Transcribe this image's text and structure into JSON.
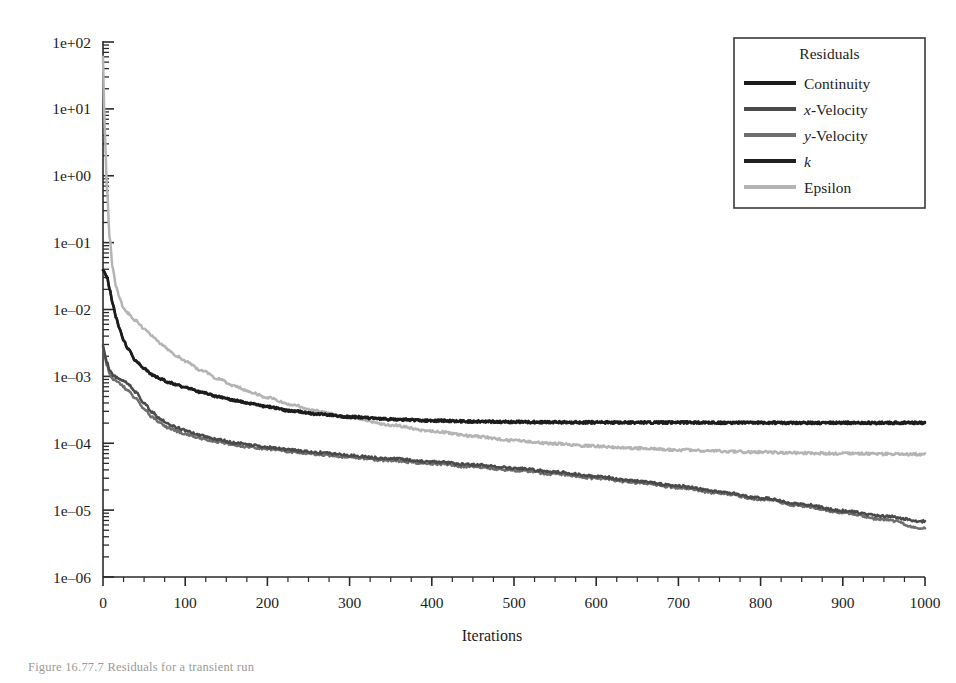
{
  "figure": {
    "caption": "Figure 16.77.7   Residuals for a transient run"
  },
  "chart_data": {
    "type": "line",
    "title": "",
    "xlabel": "Iterations",
    "ylabel": "",
    "xlim": [
      0,
      1000
    ],
    "ylim": [
      1e-06,
      100.0
    ],
    "yscale": "log",
    "grid": false,
    "legend_position": "top-right",
    "legend_title": "Residuals",
    "xticks": [
      0,
      100,
      200,
      300,
      400,
      500,
      600,
      700,
      800,
      900,
      1000
    ],
    "xtick_labels": [
      "0",
      "100",
      "200",
      "300",
      "400",
      "500",
      "600",
      "700",
      "800",
      "900",
      "1000"
    ],
    "yticks": [
      100,
      10,
      1,
      0.1,
      0.01,
      0.001,
      0.0001,
      1e-05,
      1e-06
    ],
    "ytick_labels": [
      "1e+02",
      "1e+01",
      "1e+00",
      "1e-01",
      "1e-02",
      "1e-03",
      "1e-04",
      "1e-05",
      "1e-06"
    ],
    "x": [
      0,
      2,
      5,
      8,
      12,
      16,
      20,
      25,
      30,
      40,
      50,
      60,
      70,
      80,
      90,
      100,
      120,
      140,
      160,
      180,
      200,
      230,
      260,
      300,
      350,
      400,
      450,
      500,
      550,
      600,
      650,
      700,
      750,
      800,
      850,
      900,
      950,
      1000
    ],
    "series": [
      {
        "name": "Continuity",
        "color": "#1c1c1c",
        "values": [
          0.04,
          0.035,
          0.03,
          0.02,
          0.012,
          0.0075,
          0.0052,
          0.0035,
          0.0026,
          0.0017,
          0.0013,
          0.00105,
          0.00092,
          0.00082,
          0.00074,
          0.00068,
          0.00058,
          0.0005,
          0.00044,
          0.00039,
          0.00035,
          0.000305,
          0.000275,
          0.000248,
          0.000228,
          0.000218,
          0.000212,
          0.000208,
          0.000206,
          0.000205,
          0.000204,
          0.000204,
          0.000203,
          0.000203,
          0.000202,
          0.000202,
          0.000202,
          0.000202
        ]
      },
      {
        "name": "x-Velocity",
        "color": "#4a4a4a",
        "values": [
          0.003,
          0.0022,
          0.0016,
          0.0012,
          0.00105,
          0.00098,
          0.00093,
          0.00086,
          0.00078,
          0.00058,
          0.0004,
          0.00029,
          0.00023,
          0.000195,
          0.000172,
          0.000155,
          0.00013,
          0.000114,
          0.000102,
          9.35e-05,
          8.68e-05,
          7.88e-05,
          7.26e-05,
          6.58e-05,
          5.88e-05,
          5.3e-05,
          4.78e-05,
          4.26e-05,
          3.72e-05,
          3.2e-05,
          2.72e-05,
          2.28e-05,
          1.88e-05,
          1.52e-05,
          1.22e-05,
          9.8e-06,
          8.1e-06,
          6.8e-06
        ]
      },
      {
        "name": "y-Velocity",
        "color": "#6e6e6e",
        "values": [
          0.0028,
          0.002,
          0.00145,
          0.00108,
          0.00092,
          0.00084,
          0.00078,
          0.0007,
          0.00062,
          0.00046,
          0.000325,
          0.000245,
          0.000198,
          0.00017,
          0.000152,
          0.000138,
          0.000118,
          0.000104,
          9.45e-05,
          8.72e-05,
          8.15e-05,
          7.42e-05,
          6.85e-05,
          6.2e-05,
          5.52e-05,
          4.95e-05,
          4.44e-05,
          3.96e-05,
          3.48e-05,
          3.02e-05,
          2.58e-05,
          2.18e-05,
          1.8e-05,
          1.46e-05,
          1.16e-05,
          9.2e-06,
          7.2e-06,
          5.3e-06
        ]
      },
      {
        "name": "k",
        "color": "#202020",
        "values": [
          0.04,
          0.035,
          0.03,
          0.02,
          0.012,
          0.0075,
          0.0052,
          0.0035,
          0.0026,
          0.0017,
          0.0013,
          0.00105,
          0.00092,
          0.00082,
          0.00074,
          0.00068,
          0.00058,
          0.0005,
          0.00044,
          0.00039,
          0.00035,
          0.000305,
          0.000275,
          0.000248,
          0.000228,
          0.000218,
          0.000212,
          0.000208,
          0.000206,
          0.000205,
          0.000204,
          0.000204,
          0.000203,
          0.000203,
          0.000202,
          0.000202,
          0.000202,
          0.000202
        ]
      },
      {
        "name": "Epsilon",
        "color": "#b4b4b4",
        "values": [
          60.0,
          5.0,
          0.6,
          0.12,
          0.04,
          0.022,
          0.015,
          0.0105,
          0.0088,
          0.0068,
          0.0052,
          0.004,
          0.0031,
          0.00248,
          0.00202,
          0.00168,
          0.00122,
          0.00092,
          0.00072,
          0.00058,
          0.00048,
          0.000375,
          0.000305,
          0.00024,
          0.000186,
          0.000152,
          0.000128,
          0.00011,
          9.85e-05,
          9e-05,
          8.4e-05,
          7.95e-05,
          7.6e-05,
          7.35e-05,
          7.15e-05,
          7e-05,
          6.9e-05,
          6.8e-05
        ]
      }
    ],
    "notes": {
      "continuity_plateau": "≈2.0e-04 from iteration ~350 onward",
      "k_plateau": "≈2.0e-04 (overlaps Continuity)",
      "epsilon_plateau": "≈7.0e-05 from iteration ~650 onward",
      "x_velocity_final": "≈6.8e-06 at iteration 1000",
      "y_velocity_final": "≈5.3e-06 at iteration 1000",
      "velocity_crossover": "x- and y-Velocity curves cross near iteration ~680"
    }
  },
  "legend": {
    "title": "Residuals",
    "entries": [
      {
        "label": "Continuity",
        "italic_prefix": "",
        "color": "#1c1c1c"
      },
      {
        "label": "-Velocity",
        "italic_prefix": "x",
        "color": "#4a4a4a"
      },
      {
        "label": "-Velocity",
        "italic_prefix": "y",
        "color": "#6e6e6e"
      },
      {
        "label": "",
        "italic_prefix": "k",
        "color": "#202020"
      },
      {
        "label": "Epsilon",
        "italic_prefix": "",
        "color": "#b4b4b4"
      }
    ]
  },
  "axes": {
    "x_title": "Iterations"
  },
  "colors": {
    "axis": "#2a2a2a",
    "background": "#ffffff",
    "legend_border": "#3a3a3a"
  }
}
